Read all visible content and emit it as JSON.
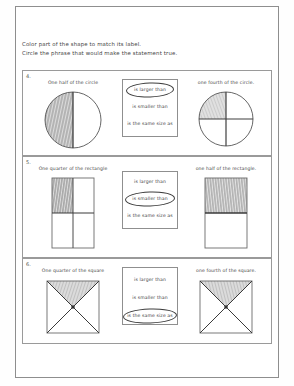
{
  "worksheet": {
    "instructions": [
      "Color part of the shape to match its label.",
      "Circle the phrase that would make the statement true."
    ],
    "problems": [
      {
        "number": "4.",
        "left_label": "One half of the circle",
        "right_label": "one fourth of the circle.",
        "left_shape": "circle-halves-left-shaded",
        "right_shape": "circle-quarters-topleft-shaded",
        "options": [
          "is larger than",
          "is smaller than",
          "is the same size as"
        ],
        "circled_index": 0
      },
      {
        "number": "5.",
        "left_label": "One quarter of the rectangle",
        "right_label": "one half of the rectangle.",
        "left_shape": "rectangle-quarters-topleft-shaded",
        "right_shape": "rectangle-halves-top-shaded",
        "options": [
          "is larger than",
          "is smaller than",
          "is the same size as"
        ],
        "circled_index": 1
      },
      {
        "number": "6.",
        "left_label": "One quarter of the square",
        "right_label": "one fourth of the square.",
        "left_shape": "square-diagonals-top-shaded",
        "right_shape": "square-diagonals-top-shaded",
        "options": [
          "is larger than",
          "is smaller than",
          "is the same size as"
        ],
        "circled_index": 2
      }
    ],
    "colors": {
      "ink": "#43433f",
      "rule": "#9a9a9a",
      "page_border": "#8e8e8e",
      "shading": "#8a8a8a",
      "circle_mark": "#3c3c3c"
    }
  }
}
